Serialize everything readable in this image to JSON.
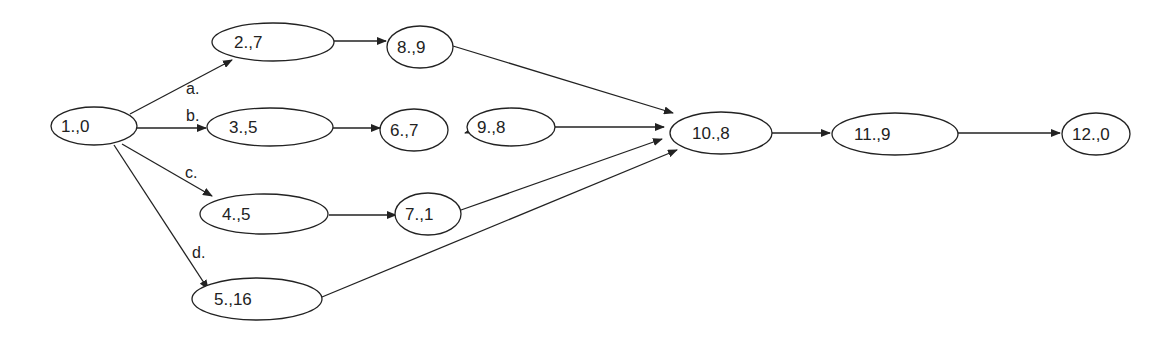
{
  "diagram": {
    "type": "directed-graph",
    "nodes": [
      {
        "id": "n1",
        "label": "1.,0",
        "cx": 94,
        "cy": 126,
        "rx": 43,
        "ry": 19
      },
      {
        "id": "n2",
        "label": "2.,7",
        "cx": 273,
        "cy": 42,
        "rx": 61,
        "ry": 19
      },
      {
        "id": "n3",
        "label": "3.,5",
        "cx": 270,
        "cy": 127,
        "rx": 63,
        "ry": 19
      },
      {
        "id": "n4",
        "label": "4.,5",
        "cx": 264,
        "cy": 214,
        "rx": 64,
        "ry": 20
      },
      {
        "id": "n5",
        "label": "5.,16",
        "cx": 257,
        "cy": 299,
        "rx": 65,
        "ry": 21
      },
      {
        "id": "n8",
        "label": "8.,9",
        "cx": 420,
        "cy": 47,
        "rx": 33,
        "ry": 21
      },
      {
        "id": "n6",
        "label": "6.,7",
        "cx": 414,
        "cy": 130,
        "rx": 34,
        "ry": 21
      },
      {
        "id": "n9",
        "label": "9.,8",
        "cx": 511,
        "cy": 127,
        "rx": 44,
        "ry": 19
      },
      {
        "id": "n7",
        "label": "7.,1",
        "cx": 428,
        "cy": 214,
        "rx": 33,
        "ry": 21
      },
      {
        "id": "n10",
        "label": "10.,8",
        "cx": 721,
        "cy": 133,
        "rx": 51,
        "ry": 21
      },
      {
        "id": "n11",
        "label": "11.,9",
        "cx": 895,
        "cy": 134,
        "rx": 63,
        "ry": 21
      },
      {
        "id": "n12",
        "label": "12.,0",
        "cx": 1096,
        "cy": 134,
        "rx": 34,
        "ry": 21
      }
    ],
    "edges": [
      {
        "from": "n1",
        "to": "n2",
        "label": "a.",
        "x1": 130,
        "y1": 114,
        "x2": 232,
        "y2": 60,
        "lx": 186,
        "ly": 94
      },
      {
        "from": "n1",
        "to": "n3",
        "label": "b.",
        "x1": 137,
        "y1": 128,
        "x2": 206,
        "y2": 128,
        "lx": 186,
        "ly": 121
      },
      {
        "from": "n1",
        "to": "n4",
        "label": "c.",
        "x1": 122,
        "y1": 144,
        "x2": 212,
        "y2": 196,
        "lx": 185,
        "ly": 178
      },
      {
        "from": "n1",
        "to": "n5",
        "label": "d.",
        "x1": 114,
        "y1": 145,
        "x2": 208,
        "y2": 289,
        "lx": 192,
        "ly": 258
      },
      {
        "from": "n2",
        "to": "n8",
        "label": "",
        "x1": 334,
        "y1": 41,
        "x2": 386,
        "y2": 41,
        "lx": 0,
        "ly": 0
      },
      {
        "from": "n3",
        "to": "n6",
        "label": "",
        "x1": 333,
        "y1": 128,
        "x2": 380,
        "y2": 128,
        "lx": 0,
        "ly": 0
      },
      {
        "from": "n9",
        "to": "n6",
        "label": "",
        "x1": 468,
        "y1": 132,
        "x2": 465,
        "y2": 133,
        "lx": 0,
        "ly": 0
      },
      {
        "from": "n4",
        "to": "n7",
        "label": "",
        "x1": 329,
        "y1": 215,
        "x2": 396,
        "y2": 215,
        "lx": 0,
        "ly": 0
      },
      {
        "from": "n8",
        "to": "n10",
        "label": "",
        "x1": 453,
        "y1": 46,
        "x2": 673,
        "y2": 113,
        "lx": 0,
        "ly": 0
      },
      {
        "from": "n9",
        "to": "n10",
        "label": "",
        "x1": 555,
        "y1": 127,
        "x2": 664,
        "y2": 127,
        "lx": 0,
        "ly": 0
      },
      {
        "from": "n7",
        "to": "n10",
        "label": "",
        "x1": 461,
        "y1": 210,
        "x2": 662,
        "y2": 139,
        "lx": 0,
        "ly": 0
      },
      {
        "from": "n5",
        "to": "n10",
        "label": "",
        "x1": 322,
        "y1": 297,
        "x2": 677,
        "y2": 150,
        "lx": 0,
        "ly": 0
      },
      {
        "from": "n10",
        "to": "n11",
        "label": "",
        "x1": 772,
        "y1": 133,
        "x2": 830,
        "y2": 133,
        "lx": 0,
        "ly": 0
      },
      {
        "from": "n11",
        "to": "n12",
        "label": "",
        "x1": 958,
        "y1": 133,
        "x2": 1060,
        "y2": 133,
        "lx": 0,
        "ly": 0
      }
    ]
  }
}
